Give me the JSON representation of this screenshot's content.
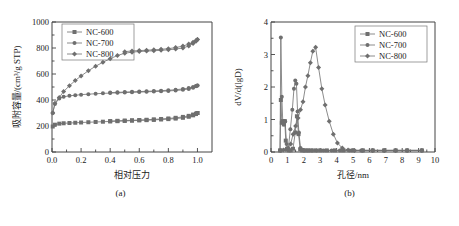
{
  "figure": {
    "panels": [
      {
        "caption": "(a)",
        "chart_data": {
          "type": "line",
          "title": "",
          "xlabel": "相对压力",
          "ylabel": "吸附容量/(cm³/g STP)",
          "xlim": [
            0.0,
            1.1
          ],
          "ylim": [
            0,
            1000
          ],
          "xticks": [
            "0.0",
            "0.2",
            "0.4",
            "0.6",
            "0.8",
            "1.0"
          ],
          "xtick_values": [
            0.0,
            0.2,
            0.4,
            0.6,
            0.8,
            1.0
          ],
          "yticks": [
            "0",
            "200",
            "400",
            "600",
            "800",
            "1000"
          ],
          "ytick_values": [
            0,
            200,
            400,
            600,
            800,
            1000
          ],
          "grid": false,
          "legend_position": "top-left",
          "series": [
            {
              "name": "NC-600",
              "marker": "square",
              "adsorption_x": [
                0.005,
                0.02,
                0.05,
                0.08,
                0.12,
                0.16,
                0.2,
                0.25,
                0.3,
                0.35,
                0.4,
                0.45,
                0.5,
                0.55,
                0.6,
                0.65,
                0.7,
                0.75,
                0.8,
                0.85,
                0.9,
                0.94,
                0.97,
                0.99,
                1.0
              ],
              "adsorption_y": [
                196,
                210,
                218,
                221,
                223,
                225,
                227,
                229,
                231,
                233,
                235,
                237,
                239,
                241,
                243,
                245,
                247,
                250,
                253,
                257,
                263,
                271,
                282,
                292,
                300
              ],
              "desorption_x": [
                1.0,
                0.99,
                0.97,
                0.94,
                0.9,
                0.85,
                0.8,
                0.75,
                0.7,
                0.65,
                0.6,
                0.55,
                0.5,
                0.45,
                0.4
              ],
              "desorption_y": [
                300,
                295,
                288,
                278,
                270,
                263,
                258,
                254,
                251,
                248,
                246,
                244,
                242,
                240,
                238
              ]
            },
            {
              "name": "NC-700",
              "marker": "circle",
              "adsorption_x": [
                0.005,
                0.02,
                0.05,
                0.08,
                0.12,
                0.16,
                0.2,
                0.25,
                0.3,
                0.35,
                0.4,
                0.45,
                0.5,
                0.55,
                0.6,
                0.65,
                0.7,
                0.75,
                0.8,
                0.85,
                0.9,
                0.94,
                0.97,
                0.99,
                1.0
              ],
              "adsorption_y": [
                300,
                370,
                412,
                425,
                432,
                437,
                441,
                445,
                448,
                451,
                453,
                455,
                457,
                459,
                461,
                463,
                465,
                467,
                470,
                473,
                478,
                485,
                495,
                505,
                512
              ],
              "desorption_x": [
                1.0,
                0.99,
                0.97,
                0.94,
                0.9,
                0.85,
                0.8,
                0.75,
                0.7,
                0.65,
                0.6,
                0.55,
                0.5,
                0.45,
                0.4
              ],
              "desorption_y": [
                512,
                508,
                500,
                492,
                485,
                479,
                475,
                472,
                469,
                467,
                465,
                463,
                461,
                459,
                457
              ]
            },
            {
              "name": "NC-800",
              "marker": "diamond",
              "adsorption_x": [
                0.005,
                0.02,
                0.05,
                0.08,
                0.12,
                0.16,
                0.2,
                0.25,
                0.3,
                0.35,
                0.4,
                0.45,
                0.5,
                0.55,
                0.6,
                0.65,
                0.7,
                0.75,
                0.8,
                0.85,
                0.9,
                0.94,
                0.97,
                0.99,
                1.0
              ],
              "adsorption_y": [
                300,
                375,
                420,
                465,
                510,
                550,
                585,
                625,
                660,
                690,
                718,
                742,
                760,
                768,
                773,
                776,
                779,
                782,
                786,
                792,
                800,
                815,
                835,
                852,
                865
              ],
              "desorption_x": [
                1.0,
                0.99,
                0.97,
                0.94,
                0.9,
                0.85,
                0.8,
                0.75,
                0.7,
                0.65,
                0.6,
                0.55,
                0.5
              ],
              "desorption_y": [
                865,
                858,
                845,
                830,
                815,
                803,
                795,
                790,
                786,
                783,
                780,
                777,
                772
              ]
            }
          ]
        }
      },
      {
        "caption": "(b)",
        "chart_data": {
          "type": "line",
          "title": "",
          "xlabel": "孔径/nm",
          "ylabel": "dV/d(lgD)",
          "xlim": [
            0,
            10
          ],
          "ylim": [
            0,
            4
          ],
          "xticks": [
            "0",
            "1",
            "2",
            "3",
            "4",
            "5",
            "6",
            "7",
            "8",
            "9",
            "10"
          ],
          "xtick_values": [
            0,
            1,
            2,
            3,
            4,
            5,
            6,
            7,
            8,
            9,
            10
          ],
          "yticks": [
            "0",
            "1",
            "2",
            "3",
            "4"
          ],
          "ytick_values": [
            0,
            1,
            2,
            3,
            4
          ],
          "grid": false,
          "legend_position": "top-right",
          "series": [
            {
              "name": "NC-600",
              "marker": "square",
              "x": [
                0.55,
                0.6,
                0.66,
                0.72,
                0.78,
                0.84,
                0.9,
                0.98,
                1.08,
                1.2,
                1.34,
                1.48,
                1.58,
                1.68,
                1.78,
                1.9,
                2.05,
                2.25,
                2.45,
                2.7,
                3.0,
                3.4,
                3.9,
                4.4,
                5.0,
                5.6,
                6.2,
                6.9,
                7.6,
                8.3,
                9.2
              ],
              "y": [
                0.05,
                1.6,
                0.9,
                0.95,
                0.85,
                0.95,
                0.35,
                0.1,
                0.05,
                0.05,
                0.1,
                0.6,
                1.1,
                0.55,
                0.08,
                0.05,
                0.05,
                0.05,
                0.05,
                0.05,
                0.05,
                0.05,
                0.05,
                0.05,
                0.05,
                0.05,
                0.05,
                0.05,
                0.05,
                0.05,
                0.05
              ]
            },
            {
              "name": "NC-700",
              "marker": "circle",
              "x": [
                0.55,
                0.6,
                0.66,
                0.72,
                0.78,
                0.86,
                0.95,
                1.05,
                1.18,
                1.3,
                1.4,
                1.48,
                1.55,
                1.62,
                1.7,
                1.8,
                1.92,
                2.05,
                2.25,
                2.5,
                2.8,
                3.2,
                3.7,
                4.2,
                4.8,
                5.5,
                6.2,
                6.9,
                7.6,
                8.3,
                9.2
              ],
              "y": [
                0.05,
                3.52,
                1.7,
                0.9,
                0.85,
                0.95,
                0.25,
                0.08,
                0.7,
                1.3,
                1.95,
                2.2,
                2.1,
                1.25,
                0.6,
                0.12,
                0.06,
                0.05,
                0.05,
                0.05,
                0.05,
                0.05,
                0.05,
                0.05,
                0.05,
                0.05,
                0.05,
                0.05,
                0.05,
                0.05,
                0.05
              ]
            },
            {
              "name": "NC-800",
              "marker": "diamond",
              "x": [
                0.6,
                0.75,
                0.9,
                1.05,
                1.2,
                1.35,
                1.5,
                1.65,
                1.8,
                1.95,
                2.1,
                2.25,
                2.4,
                2.55,
                2.72,
                2.9,
                3.1,
                3.3,
                3.55,
                3.8,
                4.05,
                4.35,
                4.7,
                5.1,
                5.6,
                6.2,
                6.9,
                7.6,
                8.3,
                9.2
              ],
              "y": [
                0.05,
                0.06,
                0.08,
                0.12,
                0.25,
                0.55,
                0.8,
                1.05,
                1.3,
                1.55,
                2.0,
                2.35,
                2.75,
                3.1,
                3.22,
                2.6,
                1.95,
                1.45,
                0.95,
                0.55,
                0.28,
                0.12,
                0.06,
                0.05,
                0.05,
                0.05,
                0.05,
                0.05,
                0.05,
                0.05
              ]
            }
          ]
        }
      }
    ]
  },
  "colors": {
    "curve": "#6f6f6f",
    "axis": "#444444",
    "text": "#1a1a1a",
    "background": "#ffffff"
  }
}
